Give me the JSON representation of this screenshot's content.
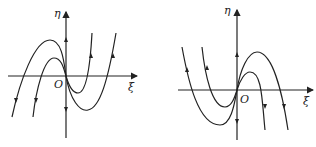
{
  "figure": {
    "panels": [
      {
        "id": "left",
        "x_label": "ξ",
        "y_label": "η",
        "origin_label": "O",
        "description": "Phase portrait: two cubic-like trajectories through origin, local max left of origin, local min right; flow upward on right branches, downward on left branches"
      },
      {
        "id": "right",
        "x_label": "ξ",
        "y_label": "η",
        "origin_label": "O",
        "description": "Mirror phase portrait: local min left of origin, local max right; flow upward on left branches, downward on right branches"
      }
    ],
    "line_color": "#222222",
    "background": "#ffffff"
  }
}
